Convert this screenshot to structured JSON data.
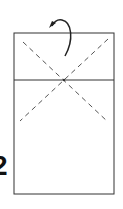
{
  "diagram": {
    "type": "origami-step",
    "step_number": "2",
    "colors": {
      "stroke": "#333333",
      "dashed": "#555555",
      "background": "#ffffff"
    },
    "paper": {
      "x": 14,
      "y": 33,
      "width": 100,
      "height": 161
    },
    "crease_line": {
      "x1": 14,
      "y1": 80,
      "x2": 114,
      "y2": 80
    },
    "valley_folds": [
      {
        "x1": 23,
        "y1": 42,
        "x2": 108,
        "y2": 122
      },
      {
        "x1": 108,
        "y1": 39,
        "x2": 20,
        "y2": 121
      }
    ],
    "arrow": {
      "label": "fold-over-arrow"
    }
  }
}
